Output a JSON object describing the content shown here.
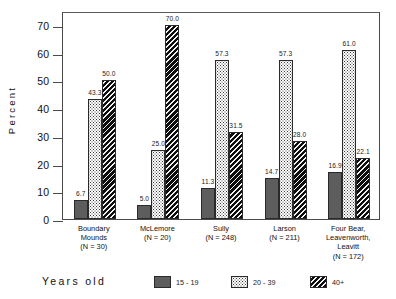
{
  "chart_data": {
    "type": "bar",
    "title": "",
    "xlabel": "",
    "ylabel": "Percent",
    "ylim": [
      0,
      75
    ],
    "yticks": [
      0,
      10,
      20,
      30,
      40,
      50,
      60,
      70
    ],
    "ytick_labels": [
      "0",
      "10",
      "20",
      "30",
      "40",
      "50",
      "60",
      "70"
    ],
    "grid": false,
    "legend_title": "Years old",
    "legend_position": "bottom",
    "categories": [
      "Boundary\nMounds\n(N = 30)",
      "McLemore\n(N = 20)",
      "Sully\n(N = 248)",
      "Larson\n(N = 211)",
      "Four Bear,\nLeavenworth,\nLeavitt\n(N = 172)"
    ],
    "series": [
      {
        "name": "15 - 19",
        "color": "#5d5d5d",
        "pattern": "solid-gray",
        "values": [
          6.7,
          5.0,
          11.3,
          14.7,
          16.9
        ],
        "labels": [
          "6.7",
          "5.0",
          "11.3",
          "14.7",
          "16.9"
        ]
      },
      {
        "name": "20 - 39",
        "color": "#ffffff",
        "pattern": "dotted-stipple",
        "values": [
          43.3,
          25.0,
          57.3,
          57.3,
          61.0
        ],
        "labels": [
          "43.3",
          "25.0",
          "57.3",
          "57.3",
          "61.0"
        ]
      },
      {
        "name": "40+",
        "color": "#0d0d0d",
        "pattern": "diagonal-hatch",
        "values": [
          50.0,
          70.0,
          31.5,
          28.0,
          22.1
        ],
        "labels": [
          "50.0",
          "70.0",
          "31.5",
          "28.0",
          "22.1"
        ]
      }
    ]
  }
}
